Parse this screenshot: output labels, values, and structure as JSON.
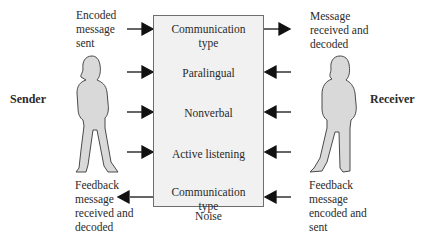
{
  "sender": {
    "label": "Sender",
    "top_note": "Encoded\nmessage\nsent",
    "bottom_note": "Feedback\nmessage\nreceived and\ndecoded"
  },
  "receiver": {
    "label": "Receiver",
    "top_note": "Message\nreceived and\ndecoded",
    "bottom_note": "Feedback\nmessage\nencoded and\nsent"
  },
  "channel": {
    "items": [
      {
        "label": "Communication\ntype"
      },
      {
        "label": "Paralingual"
      },
      {
        "label": "Nonverbal"
      },
      {
        "label": "Active listening"
      },
      {
        "label": "Communication\ntype"
      }
    ],
    "footer": "Noise"
  },
  "arrows": {
    "left": [
      "right",
      "right",
      "right",
      "right",
      "left"
    ],
    "right": [
      "right",
      "left",
      "left",
      "left",
      "left"
    ]
  },
  "colors": {
    "box_fill": "#f1f1f1",
    "box_border": "#6e6e6e",
    "figure_fill": "#d9d9d9",
    "figure_stroke": "#4a4a4a",
    "arrow": "#111111"
  }
}
